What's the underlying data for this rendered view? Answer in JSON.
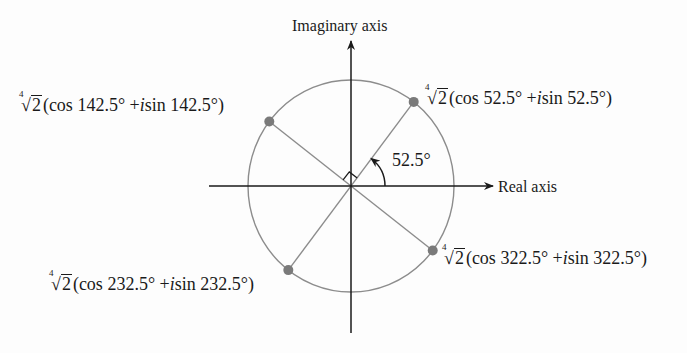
{
  "figure": {
    "axes": {
      "imaginary_label": "Imaginary axis",
      "real_label": "Real axis"
    },
    "angle_marker": {
      "label": "52.5°",
      "degrees": 52.5
    },
    "right_angle_marker": true,
    "colors": {
      "axis": "#1a1a1a",
      "circle": "#8c8c8c",
      "ray": "#8c8c8c",
      "point": "#7a7a7a",
      "text": "#1a1a1a"
    },
    "geometry": {
      "center": [
        351,
        186
      ],
      "radius_x": 103,
      "radius_y": 106
    },
    "roots": [
      {
        "angle": 52.5,
        "radical_index": "4",
        "radicand": "2",
        "cos_part": "(cos 52.5° + ",
        "i": "i",
        "sin_part": "sin 52.5°)"
      },
      {
        "angle": 142.5,
        "radical_index": "4",
        "radicand": "2",
        "cos_part": "(cos 142.5° + ",
        "i": "i",
        "sin_part": "sin 142.5°)"
      },
      {
        "angle": 232.5,
        "radical_index": "4",
        "radicand": "2",
        "cos_part": "(cos 232.5° + ",
        "i": "i",
        "sin_part": "sin 232.5°)"
      },
      {
        "angle": 322.5,
        "radical_index": "4",
        "radicand": "2",
        "cos_part": "(cos 322.5° + ",
        "i": "i",
        "sin_part": "sin 322.5°)"
      }
    ]
  }
}
